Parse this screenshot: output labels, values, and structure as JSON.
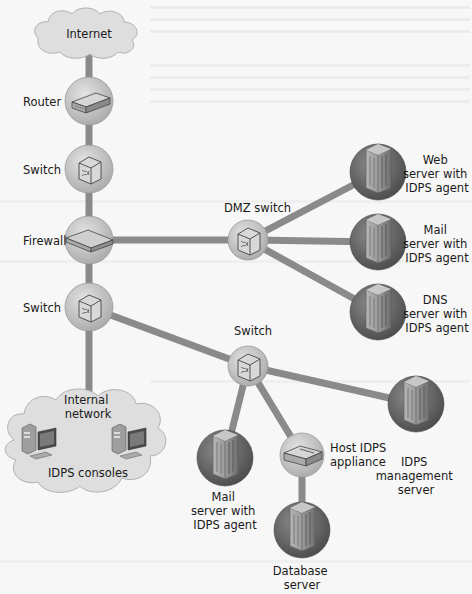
{
  "diagram": {
    "colors": {
      "background": "#f7f7f7",
      "link": "#8a8a8a",
      "device_bubble": "#c9c9c9",
      "server_bubble": "#6e6e6e",
      "cloud": "#dedede",
      "text": "#1a1a1a"
    },
    "nodes": [
      {
        "id": "internet",
        "type": "cloud",
        "icon": "cloud-icon",
        "label": [
          "Internet"
        ],
        "x": 89,
        "y": 34
      },
      {
        "id": "router",
        "type": "device",
        "icon": "router-icon",
        "label": [
          "Router"
        ],
        "x": 89,
        "y": 101
      },
      {
        "id": "switch-top",
        "type": "device",
        "icon": "switch-icon",
        "label": [
          "Switch"
        ],
        "x": 89,
        "y": 169
      },
      {
        "id": "firewall",
        "type": "device",
        "icon": "firewall-icon",
        "label": [
          "Firewall"
        ],
        "x": 89,
        "y": 240
      },
      {
        "id": "switch-internal",
        "type": "device",
        "icon": "switch-icon",
        "label": [
          "Switch"
        ],
        "x": 89,
        "y": 307
      },
      {
        "id": "dmz-switch",
        "type": "device",
        "icon": "switch-icon",
        "label": [
          "DMZ switch"
        ],
        "x": 248,
        "y": 240
      },
      {
        "id": "web-server",
        "type": "server",
        "icon": "server-icon",
        "label": [
          "Web",
          "server with",
          "IDPS agent"
        ],
        "x": 378,
        "y": 172
      },
      {
        "id": "mail-server-dmz",
        "type": "server",
        "icon": "server-icon",
        "label": [
          "Mail",
          "server with",
          "IDPS agent"
        ],
        "x": 378,
        "y": 242
      },
      {
        "id": "dns-server",
        "type": "server",
        "icon": "server-icon",
        "label": [
          "DNS",
          "server with",
          "IDPS agent"
        ],
        "x": 378,
        "y": 312
      },
      {
        "id": "switch-lower",
        "type": "device",
        "icon": "switch-icon",
        "label": [
          "Switch"
        ],
        "x": 248,
        "y": 366
      },
      {
        "id": "mail-server-internal",
        "type": "server",
        "icon": "server-icon",
        "label": [
          "Mail",
          "server with",
          "IDPS agent"
        ],
        "x": 225,
        "y": 458
      },
      {
        "id": "host-idps-appliance",
        "type": "device",
        "icon": "appliance-icon",
        "label": [
          "Host IDPS",
          "appliance"
        ],
        "x": 302,
        "y": 455
      },
      {
        "id": "idps-management-server",
        "type": "server",
        "icon": "server-icon",
        "label": [
          "IDPS",
          "management",
          "server"
        ],
        "x": 416,
        "y": 404
      },
      {
        "id": "database-server",
        "type": "server",
        "icon": "server-icon",
        "label": [
          "Database",
          "server"
        ],
        "x": 302,
        "y": 530
      },
      {
        "id": "internal-network",
        "type": "cloud",
        "icon": "cloud-icon",
        "label": [
          "Internal",
          "network"
        ],
        "sublabel": "IDPS consoles",
        "x": 88,
        "y": 445
      }
    ],
    "links": [
      [
        "internet",
        "router"
      ],
      [
        "router",
        "switch-top"
      ],
      [
        "switch-top",
        "firewall"
      ],
      [
        "firewall",
        "switch-internal"
      ],
      [
        "firewall",
        "dmz-switch"
      ],
      [
        "dmz-switch",
        "web-server"
      ],
      [
        "dmz-switch",
        "mail-server-dmz"
      ],
      [
        "dmz-switch",
        "dns-server"
      ],
      [
        "switch-internal",
        "internal-network"
      ],
      [
        "switch-internal",
        "switch-lower"
      ],
      [
        "switch-lower",
        "mail-server-internal"
      ],
      [
        "switch-lower",
        "host-idps-appliance"
      ],
      [
        "switch-lower",
        "idps-management-server"
      ],
      [
        "host-idps-appliance",
        "database-server"
      ]
    ]
  },
  "labels": {
    "internet": "Internet",
    "router": "Router",
    "switch_top": "Switch",
    "firewall": "Firewall",
    "switch_internal": "Switch",
    "dmz_switch": "DMZ switch",
    "web_server": [
      "Web",
      "server with",
      "IDPS agent"
    ],
    "mail_server_dmz": [
      "Mail",
      "server with",
      "IDPS agent"
    ],
    "dns_server": [
      "DNS",
      "server with",
      "IDPS agent"
    ],
    "switch_lower": "Switch",
    "internal_network": [
      "Internal",
      "network"
    ],
    "idps_consoles": "IDPS consoles",
    "mail_server_internal": [
      "Mail",
      "server with",
      "IDPS agent"
    ],
    "host_idps_appliance": [
      "Host IDPS",
      "appliance"
    ],
    "idps_management_server": [
      "IDPS",
      "management",
      "server"
    ],
    "database_server": [
      "Database",
      "server"
    ]
  }
}
